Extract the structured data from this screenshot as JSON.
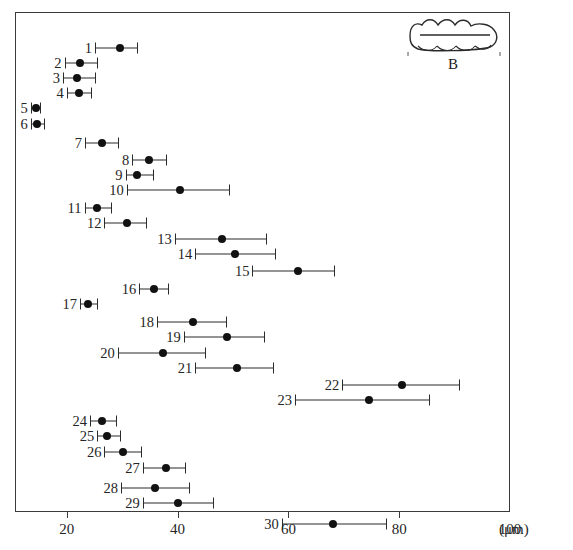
{
  "chart_data": {
    "type": "scatter",
    "title": "",
    "xlabel": "(μm)",
    "ylabel": "",
    "xlim": [
      8,
      100
    ],
    "grid": false,
    "legend": "none",
    "axis": {
      "unit": "(μm)",
      "ticks": [
        20,
        40,
        60,
        80,
        100
      ],
      "tick_labels": [
        "20",
        "40",
        "60",
        "80",
        "100"
      ]
    },
    "value_key": "mean with min-max range",
    "categories": [
      "1",
      "2",
      "3",
      "4",
      "5",
      "6",
      "7",
      "8",
      "9",
      "10",
      "11",
      "12",
      "13",
      "14",
      "15",
      "16",
      "17",
      "18",
      "19",
      "20",
      "21",
      "22",
      "23",
      "24",
      "25",
      "26",
      "27",
      "28",
      "29",
      "30"
    ],
    "points": [
      {
        "label": "1",
        "min": 25.1,
        "mean": 29.6,
        "max": 32.9
      },
      {
        "label": "2",
        "min": 19.6,
        "mean": 22.3,
        "max": 25.6
      },
      {
        "label": "3",
        "min": 19.3,
        "mean": 21.8,
        "max": 25.3
      },
      {
        "label": "4",
        "min": 20.0,
        "mean": 22.2,
        "max": 24.5
      },
      {
        "label": "5",
        "min": 13.5,
        "mean": 14.4,
        "max": 15.3
      },
      {
        "label": "6",
        "min": 13.5,
        "mean": 14.6,
        "max": 16.0
      },
      {
        "label": "7",
        "min": 23.3,
        "mean": 26.4,
        "max": 29.4
      },
      {
        "label": "8",
        "min": 31.8,
        "mean": 34.9,
        "max": 38.1
      },
      {
        "label": "9",
        "min": 30.6,
        "mean": 32.6,
        "max": 35.7
      },
      {
        "label": "10",
        "min": 30.8,
        "mean": 40.5,
        "max": 49.5
      },
      {
        "label": "11",
        "min": 23.2,
        "mean": 25.5,
        "max": 28.1
      },
      {
        "label": "12",
        "min": 26.8,
        "mean": 30.8,
        "max": 34.5
      },
      {
        "label": "13",
        "min": 39.5,
        "mean": 48.0,
        "max": 56.1
      },
      {
        "label": "14",
        "min": 43.2,
        "mean": 50.4,
        "max": 57.7
      },
      {
        "label": "15",
        "min": 53.5,
        "mean": 61.8,
        "max": 68.5
      },
      {
        "label": "16",
        "min": 33.1,
        "mean": 35.7,
        "max": 38.5
      },
      {
        "label": "17",
        "min": 22.4,
        "mean": 23.8,
        "max": 25.7
      },
      {
        "label": "18",
        "min": 36.3,
        "mean": 42.7,
        "max": 49.0
      },
      {
        "label": "19",
        "min": 41.1,
        "mean": 49.0,
        "max": 55.8
      },
      {
        "label": "20",
        "min": 29.2,
        "mean": 37.4,
        "max": 45.2
      },
      {
        "label": "21",
        "min": 43.2,
        "mean": 50.8,
        "max": 57.4
      },
      {
        "label": "22",
        "min": 69.7,
        "mean": 80.5,
        "max": 91.0
      },
      {
        "label": "23",
        "min": 61.2,
        "mean": 74.5,
        "max": 85.5
      },
      {
        "label": "24",
        "min": 24.2,
        "mean": 26.4,
        "max": 29.0
      },
      {
        "label": "25",
        "min": 25.5,
        "mean": 27.3,
        "max": 29.8
      },
      {
        "label": "26",
        "min": 26.8,
        "mean": 30.2,
        "max": 33.5
      },
      {
        "label": "27",
        "min": 33.7,
        "mean": 37.9,
        "max": 41.5
      },
      {
        "label": "28",
        "min": 29.8,
        "mean": 36.0,
        "max": 42.2
      },
      {
        "label": "29",
        "min": 33.7,
        "mean": 40.1,
        "max": 46.6
      },
      {
        "label": "30",
        "min": 58.8,
        "mean": 68.0,
        "max": 77.8
      }
    ]
  },
  "inset": {
    "label": "B",
    "shape_name": "organism-outline"
  }
}
